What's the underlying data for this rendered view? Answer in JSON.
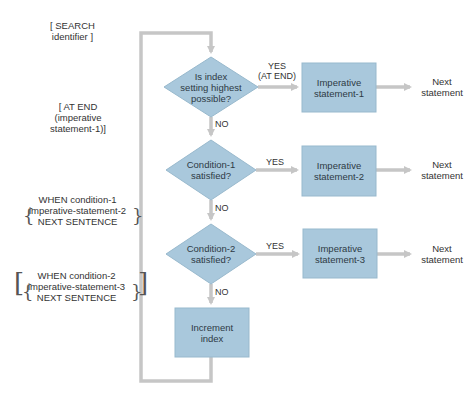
{
  "colors": {
    "node_fill": "#a9c8dc",
    "node_stroke": "#8fb2c8",
    "line": "#c6c6c6",
    "text": "#333333"
  },
  "syntax_labels": {
    "search": [
      "[ SEARCH",
      "identifier ]"
    ],
    "at_end": [
      "[ AT END",
      "(imperative",
      "statement-1)]"
    ],
    "when1": [
      "WHEN condition-1",
      "imperative-statement-2",
      "NEXT SENTENCE"
    ],
    "when2": [
      "WHEN condition-2",
      "imperative-statement-3",
      "NEXT SENTENCE"
    ]
  },
  "nodes": {
    "decision1": [
      "Is index",
      "setting highest",
      "possible?"
    ],
    "decision2": [
      "Condition-1",
      "satisfied?"
    ],
    "decision3": [
      "Condition-2",
      "satisfied?"
    ],
    "process1": [
      "Imperative",
      "statement-1"
    ],
    "process2": [
      "Imperative",
      "statement-2"
    ],
    "process3": [
      "Imperative",
      "statement-3"
    ],
    "process4": [
      "Increment",
      "index"
    ]
  },
  "edges": {
    "yes_at_end": [
      "YES",
      "(AT END)"
    ],
    "yes": "YES",
    "no": "NO"
  },
  "terminals": {
    "next1": [
      "Next",
      "statement"
    ],
    "next2": [
      "Next",
      "statement"
    ],
    "next3": [
      "Next",
      "statement"
    ]
  }
}
